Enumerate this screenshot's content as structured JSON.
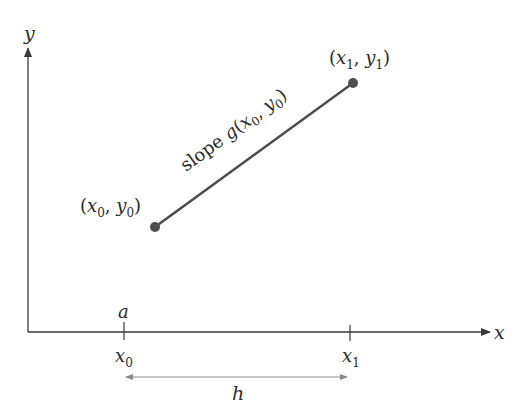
{
  "diagram": {
    "type": "secant-line-on-axes",
    "colors": {
      "axis": "#3a3a3a",
      "line": "#4a4a4a",
      "point": "#4d4d4d",
      "text": "#2b2b2b",
      "dim": "#777777"
    },
    "axes": {
      "x_label": "x",
      "y_label": "y"
    },
    "points": [
      {
        "id": "p0",
        "label_var_x": "x",
        "label_sub_x": "0",
        "label_var_y": "y",
        "label_sub_y": "0",
        "x_px": 155,
        "y_px": 227
      },
      {
        "id": "p1",
        "label_var_x": "x",
        "label_sub_x": "1",
        "label_var_y": "y",
        "label_sub_y": "1",
        "x_px": 353,
        "y_px": 83
      }
    ],
    "segment": {
      "label_prefix": "slope ",
      "label_fn": "g",
      "label_var_x": "x",
      "label_sub_x": "0",
      "label_var_y": "y",
      "label_sub_y": "0"
    },
    "ticks": [
      {
        "above": "a",
        "below_var": "x",
        "below_sub": "0"
      },
      {
        "above": "",
        "below_var": "x",
        "below_sub": "1"
      }
    ],
    "dimension": {
      "label": "h"
    }
  }
}
